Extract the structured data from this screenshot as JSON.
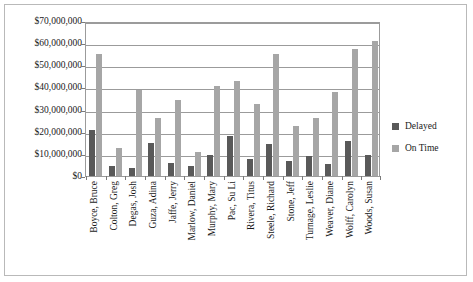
{
  "chart_data": {
    "type": "bar",
    "title": "",
    "subtitle": "",
    "xlabel": "",
    "ylabel": "",
    "ylim": [
      0,
      70000000
    ],
    "ytick_values": [
      0,
      10000000,
      20000000,
      30000000,
      40000000,
      50000000,
      60000000,
      70000000
    ],
    "ytick_labels": [
      "$0",
      "$10,000,000",
      "$20,000,000",
      "$30,000,000",
      "$40,000,000",
      "$50,000,000",
      "$60,000,000",
      "$70,000,000"
    ],
    "grid": true,
    "legend_position": "right",
    "categories": [
      "Boyce, Bruce",
      "Colton, Greg",
      "Degas, Josh",
      "Guza, Adina",
      "Jaffe, Jerry",
      "Marlow, Daniel",
      "Murphy, Mary",
      "Pac, Su Li",
      "Rivera, Titus",
      "Steele, Richard",
      "Stone, Jeff",
      "Turnage, Leslie",
      "Weaver, Diane",
      "Wolff, Carolyn",
      "Woods, Susan"
    ],
    "series": [
      {
        "name": "Delayed",
        "color": "#595959",
        "values": [
          21000000,
          4500000,
          3500000,
          15000000,
          6000000,
          4500000,
          9500000,
          18000000,
          7500000,
          14500000,
          7000000,
          9000000,
          5500000,
          16000000,
          9500000
        ]
      },
      {
        "name": "On Time",
        "color": "#a6a6a6",
        "values": [
          55000000,
          12500000,
          39000000,
          26000000,
          34500000,
          11000000,
          40500000,
          43000000,
          32500000,
          55000000,
          22500000,
          26000000,
          38000000,
          57500000,
          61000000
        ]
      }
    ]
  },
  "legend": {
    "items": [
      {
        "label": "Delayed",
        "color": "#595959"
      },
      {
        "label": "On Time",
        "color": "#a6a6a6"
      }
    ]
  },
  "colors": {
    "delayed": "#595959",
    "on_time": "#a6a6a6",
    "gridline": "#9b9b9b",
    "frame": "#b9b9b9",
    "text": "#1a1a1a"
  }
}
